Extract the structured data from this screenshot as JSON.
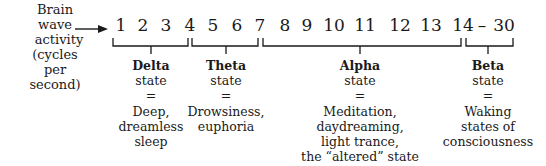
{
  "axis_label": {
    "lines": [
      "Brain wave",
      "activity",
      "(cycles per",
      "second)"
    ]
  },
  "scale": {
    "numbers": [
      {
        "text": "1",
        "x": 121
      },
      {
        "text": "2",
        "x": 143
      },
      {
        "text": "3",
        "x": 166
      },
      {
        "text": "4",
        "x": 190
      },
      {
        "text": "5",
        "x": 213
      },
      {
        "text": "6",
        "x": 237
      },
      {
        "text": "7",
        "x": 260
      },
      {
        "text": "8",
        "x": 285
      },
      {
        "text": "9",
        "x": 307
      },
      {
        "text": "10",
        "x": 334
      },
      {
        "text": "11",
        "x": 365
      },
      {
        "text": "12",
        "x": 400
      },
      {
        "text": "13",
        "x": 431
      },
      {
        "text": "14",
        "x": 463
      },
      {
        "text": "–",
        "x": 482
      },
      {
        "text": "30",
        "x": 504
      }
    ]
  },
  "states": [
    {
      "name": "Delta",
      "sub": "state",
      "eq": "=",
      "desc": [
        "Deep,",
        "dreamless",
        "sleep"
      ],
      "x": 151,
      "range": [
        113,
        188
      ]
    },
    {
      "name": "Theta",
      "sub": "state",
      "eq": "=",
      "desc": [
        "Drowsiness,",
        "euphoria"
      ],
      "x": 226,
      "range": [
        192,
        258
      ]
    },
    {
      "name": "Alpha",
      "sub": "state",
      "eq": "=",
      "desc": [
        "Meditation,",
        "daydreaming,",
        "light trance,",
        "the “altered” state"
      ],
      "x": 360,
      "range": [
        263,
        461
      ]
    },
    {
      "name": "Beta",
      "sub": "state",
      "eq": "=",
      "desc": [
        "Waking",
        "states of",
        "consciousness"
      ],
      "x": 488,
      "range": [
        466,
        513
      ]
    }
  ]
}
